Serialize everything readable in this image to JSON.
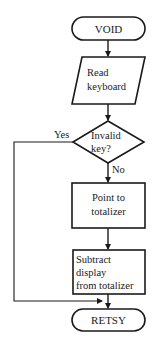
{
  "diagram": {
    "type": "flowchart",
    "stroke_color": "#1a1a1a",
    "background": "#ffffff",
    "nodes": [
      {
        "id": "start",
        "shape": "terminal",
        "label": "VOID"
      },
      {
        "id": "read",
        "shape": "parallelogram",
        "label_lines": [
          "Read",
          "keyboard"
        ]
      },
      {
        "id": "decision",
        "shape": "diamond",
        "label_lines": [
          "Invalid",
          "key?"
        ]
      },
      {
        "id": "point",
        "shape": "rectangle",
        "label_lines": [
          "Point to",
          "totalizer"
        ]
      },
      {
        "id": "subtract",
        "shape": "rectangle",
        "label_lines": [
          "Subtract",
          "display",
          "from totalizer"
        ]
      },
      {
        "id": "end",
        "shape": "terminal",
        "label": "RETSY"
      }
    ],
    "edges": [
      {
        "from": "start",
        "to": "read"
      },
      {
        "from": "read",
        "to": "decision"
      },
      {
        "from": "decision",
        "to": "point",
        "label": "No"
      },
      {
        "from": "decision",
        "to": "end",
        "label": "Yes"
      },
      {
        "from": "point",
        "to": "subtract"
      },
      {
        "from": "subtract",
        "to": "end"
      }
    ],
    "edge_labels": {
      "yes": "Yes",
      "no": "No"
    }
  }
}
